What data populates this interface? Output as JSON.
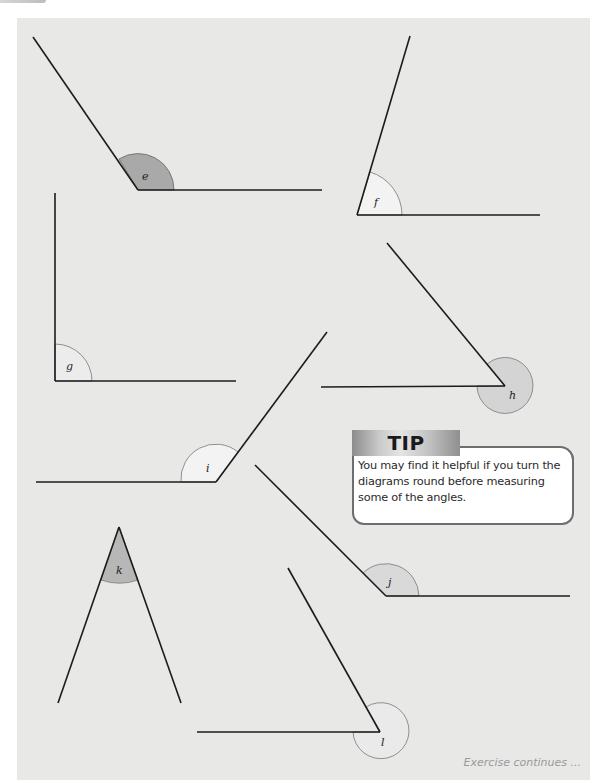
{
  "page": {
    "background": "#ffffff",
    "panel_color": "#e8e8e7"
  },
  "angles": [
    {
      "label": "e",
      "shade": "#a9a9a9"
    },
    {
      "label": "f",
      "shade": "#f3f3f3"
    },
    {
      "label": "g",
      "shade": "#ececec"
    },
    {
      "label": "h",
      "shade": "#d4d4d4"
    },
    {
      "label": "i",
      "shade": "#f3f3f3"
    },
    {
      "label": "j",
      "shade": "#d9d9d9"
    },
    {
      "label": "k",
      "shade": "#b7b7b7"
    },
    {
      "label": "l",
      "shade": "#eaeaea"
    }
  ],
  "tip": {
    "title": "TIP",
    "text": "You may find it helpful if you turn the diagrams round before measuring some of the angles."
  },
  "footer": {
    "continues": "Exercise continues ..."
  }
}
